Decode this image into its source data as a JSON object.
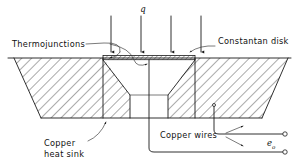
{
  "figure": {
    "background_color": "#ffffff",
    "line_color": "#1a1a1a"
  },
  "labels": {
    "heat_flux": "q",
    "thermojunctions": "Thermojunctions",
    "constantan_disk": "Constantan disk",
    "copper_heat_sink_line1": "Copper",
    "copper_heat_sink_line2": "heat sink",
    "copper_wires": "Copper wires",
    "output_voltage": "e",
    "output_voltage_subscript": "o"
  },
  "components": {
    "heat_flux_arrows": {
      "name": "incident-heat-flux",
      "count": 4,
      "direction": "down",
      "x_positions": [
        111,
        141,
        171,
        201
      ],
      "y_top": 16,
      "y_bottom": 57
    },
    "constantan_disk": {
      "name": "constantan-disk",
      "description": "thin hatched strip spanning cavity top",
      "x_start": 103,
      "x_end": 195,
      "y_top": 56,
      "y_bottom": 60
    },
    "heat_sink": {
      "name": "copper-heat-sink",
      "description": "hatched block with conical cavity",
      "top_surface_y": 58,
      "bottom_y": 118
    },
    "cavity": {
      "name": "central-cavity",
      "description": "unhatched trapezoidal bore below disk"
    },
    "terminals": {
      "name": "output-terminals",
      "count": 2,
      "x": 284,
      "y_positions": [
        128,
        146
      ]
    }
  }
}
